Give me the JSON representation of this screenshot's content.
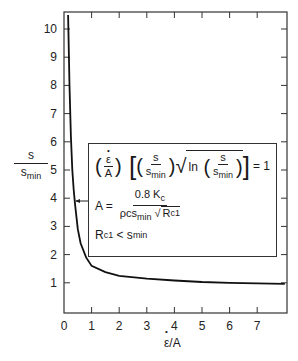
{
  "chart_data": {
    "type": "line",
    "title": "",
    "xlabel": "ε̇/A",
    "ylabel": "s / s_min",
    "xlim": [
      0,
      8
    ],
    "ylim": [
      0,
      10.5
    ],
    "x_ticks": [
      0,
      1,
      2,
      3,
      4,
      5,
      6,
      7
    ],
    "y_ticks": [
      1,
      2,
      3,
      4,
      5,
      6,
      7,
      8,
      9,
      10
    ],
    "grid": false,
    "legend": null,
    "series": [
      {
        "name": "s/s_min vs ε̇/A",
        "x": [
          0.15,
          0.2,
          0.25,
          0.3,
          0.35,
          0.4,
          0.5,
          0.6,
          0.8,
          1.0,
          1.5,
          2.0,
          3.0,
          4.0,
          5.0,
          6.0,
          7.0,
          8.0
        ],
        "y": [
          10.5,
          8.0,
          6.2,
          5.0,
          4.3,
          3.8,
          2.9,
          2.4,
          1.9,
          1.6,
          1.38,
          1.25,
          1.15,
          1.08,
          1.03,
          1.0,
          0.98,
          0.96
        ]
      }
    ],
    "annotations": [
      "(ε̇/A) [ (s/s_min) √ln(s/s_min) ] = 1",
      "A = 0.8 K_c / (ρ c s_min √R_c1)",
      "R_c1 < s_min"
    ]
  },
  "axes": {
    "x_tick_labels": [
      "0",
      "1",
      "2",
      "3",
      "4",
      "5",
      "6",
      "7"
    ],
    "y_tick_labels": [
      "1",
      "2",
      "3",
      "4",
      "5",
      "6",
      "7",
      "8",
      "9",
      "10"
    ],
    "ylabel_num": "s",
    "ylabel_den": "s",
    "ylabel_den_sub": "min",
    "xlabel_e": "ε",
    "xlabel_rest": "/A"
  },
  "formula": {
    "eq1_lhs_num": "ε",
    "eq1_lhs_den": "A",
    "s": "s",
    "smin": "s",
    "min": "min",
    "ln": "ln",
    "eq1_rhs": "= 1",
    "eq2_lhs": "A =",
    "eq2_num": "0.8 K",
    "eq2_num_sub": "c",
    "eq2_den_a": "ρcs",
    "eq2_den_sub": "min",
    "eq2_den_r": "R",
    "eq2_den_r_sub": "c1",
    "eq3_r": "R",
    "eq3_r_sub": "c1",
    "eq3_op": " < s",
    "eq3_sub": "min"
  },
  "colors": {
    "line": "#111111",
    "axis": "#333333",
    "background": "#ffffff"
  }
}
